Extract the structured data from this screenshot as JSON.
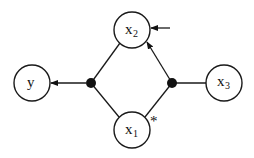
{
  "diagram": {
    "type": "node-graph",
    "nodes": [
      {
        "id": "x2",
        "label": "x",
        "subscript": "2"
      },
      {
        "id": "y",
        "label": "y",
        "subscript": ""
      },
      {
        "id": "x3",
        "label": "x",
        "subscript": "3"
      },
      {
        "id": "x1",
        "label": "x",
        "subscript": "1"
      }
    ],
    "junctions": [
      {
        "id": "j-left"
      },
      {
        "id": "j-right"
      }
    ],
    "edges": [
      {
        "from": "x2",
        "to": "j-left",
        "arrow": false
      },
      {
        "from": "x1",
        "to": "j-left",
        "arrow": false
      },
      {
        "from": "j-left",
        "to": "y",
        "arrow": true
      },
      {
        "from": "x3",
        "to": "j-right",
        "arrow": false
      },
      {
        "from": "x1",
        "to": "j-right",
        "arrow": false
      },
      {
        "from": "j-right",
        "to": "x2",
        "arrow": true
      },
      {
        "from": "external",
        "to": "x2",
        "arrow": true
      }
    ],
    "annotations": [
      {
        "id": "x1-star",
        "text": "*",
        "near": "x1"
      }
    ]
  }
}
